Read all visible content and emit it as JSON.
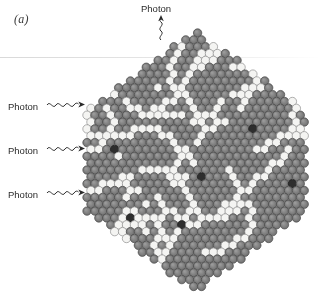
{
  "figure": {
    "panel_label": "(a)",
    "caption_alt": "Hexagonal close-packed array of scintillator grains with photon tracks"
  },
  "annotations": [
    {
      "name": "photon-top",
      "label": "Photon",
      "direction": "up",
      "x": 141,
      "y": 3
    },
    {
      "name": "photon-left-1",
      "label": "Photon",
      "direction": "right",
      "x": 8,
      "y": 101
    },
    {
      "name": "photon-left-2",
      "label": "Photon",
      "direction": "right",
      "x": 8,
      "y": 145
    },
    {
      "name": "photon-left-3",
      "label": "Photon",
      "direction": "right",
      "x": 8,
      "y": 189
    }
  ],
  "colors": {
    "grain_gray": "#7e7e7e",
    "grain_gray_dark_edge": "#4a4a4a",
    "grain_white": "#f4f4f2",
    "grain_dark": "#2e2e2e",
    "background": "#ffffff",
    "text": "#2b2b2b",
    "panel_label_text": "#3a3a3a"
  },
  "lattice": {
    "type": "hexagonal-close-packed",
    "shape": "hexagon",
    "circle_diameter": 8.4,
    "pitch_x": 7.9,
    "pitch_y": 6.85,
    "center_x": 196,
    "center_y": 161,
    "rows": 38,
    "columns_max": 28,
    "apex_top": {
      "x": 196,
      "y": 33
    },
    "apex_bottom": {
      "x": 214,
      "y": 291
    },
    "left_edge_x": 87,
    "right_edge_x": 306,
    "grain_states": [
      "gray",
      "white",
      "dark"
    ],
    "white_fraction": 0.11,
    "dark_fraction": 0.012,
    "white_tracks_description": "meandering chains of white grains forming photon scattering tracks radiating from left entry points toward the top apex",
    "white_track_seeds": [
      [
        12,
        22
      ],
      [
        13,
        22
      ],
      [
        14,
        21
      ],
      [
        15,
        21
      ],
      [
        16,
        20
      ],
      [
        17,
        20
      ],
      [
        18,
        19
      ],
      [
        10,
        24
      ],
      [
        11,
        24
      ],
      [
        12,
        25
      ],
      [
        13,
        25
      ],
      [
        14,
        26
      ],
      [
        20,
        15
      ],
      [
        21,
        15
      ],
      [
        22,
        14
      ],
      [
        23,
        14
      ],
      [
        24,
        13
      ]
    ],
    "dark_grain_positions": [
      [
        5,
        21
      ],
      [
        7,
        9
      ],
      [
        12,
        4
      ],
      [
        14,
        29
      ],
      [
        17,
        6
      ],
      [
        19,
        25
      ],
      [
        22,
        11
      ],
      [
        25,
        18
      ],
      [
        28,
        13
      ],
      [
        31,
        9
      ],
      [
        33,
        22
      ],
      [
        35,
        17
      ]
    ]
  }
}
